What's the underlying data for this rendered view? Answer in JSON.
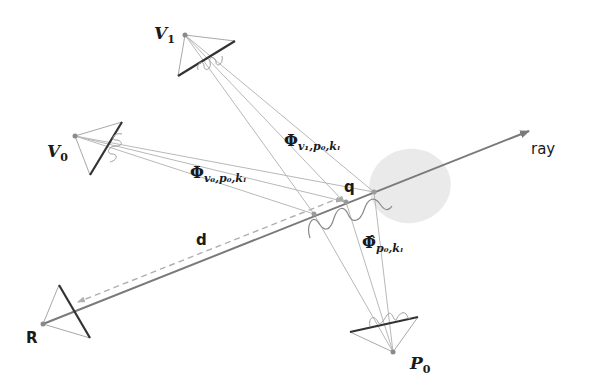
{
  "figure": {
    "labels": {
      "v1": "V",
      "v1_sub": "1",
      "v0": "V",
      "v0_sub": "0",
      "r": "R",
      "p0": "P",
      "p0_sub": "0",
      "ray": "ray",
      "q": "q",
      "d": "d",
      "phi_v1": "Φ",
      "phi_v1_sub": "v₁,p₀,kₗ",
      "phi_v0": "Φ",
      "phi_v0_sub": "v₀,p₀,kₗ",
      "phi_hat_p0": "Φ̂",
      "phi_hat_p0_sub": "p₀,kₗ"
    },
    "colors": {
      "ray": "#7a7a7a",
      "camera_plane": "#333333",
      "camera_edges": "#a8a8a8",
      "rays_thin": "#b5b5b5",
      "ellipse": "#e6e6e6",
      "dashed": "#b0b0b0",
      "wave": "#8a8a8a"
    }
  }
}
